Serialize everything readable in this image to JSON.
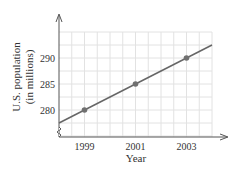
{
  "chart_data": {
    "type": "line",
    "title": "",
    "xlabel": "Year",
    "ylabel": "U.S. population (in millions)",
    "ylabel_lines": [
      "U.S. population",
      "(in millions)"
    ],
    "x_ticks": [
      "1999",
      "2001",
      "2003"
    ],
    "y_ticks": [
      "280",
      "285",
      "290"
    ],
    "points": [
      {
        "x": 1999,
        "y": 280
      },
      {
        "x": 2001,
        "y": 285
      },
      {
        "x": 2003,
        "y": 290
      }
    ],
    "line_extent": {
      "x_start": 1998,
      "y_start": 277.5,
      "x_end": 2004,
      "y_end": 292.5
    },
    "xlim": [
      1998,
      2004
    ],
    "ylim": [
      277.5,
      292.5
    ],
    "y_axis_break": true,
    "grid": true,
    "colors": {
      "line": "#666666",
      "points": "#707070",
      "grid": "#e2e2e2",
      "axis": "#555555"
    }
  }
}
